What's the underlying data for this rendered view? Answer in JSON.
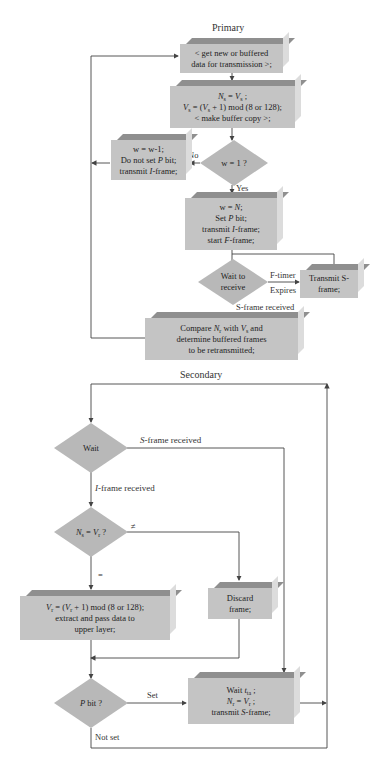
{
  "primary": {
    "title": "Primary",
    "get_data_box": {
      "line1": "< get new or buffered",
      "line2": "data for transmission >;"
    },
    "seq_box": {
      "line1_a": "N",
      "line1_sub": "s",
      "line1_b": " = ",
      "line1_c": "V",
      "line1_sub2": "s",
      "line1_d": " ;",
      "line2": "V_s = (V_s + 1) mod (8 or 128);",
      "line2_a": "V",
      "line2_sub": "s",
      "line2_b": " = (",
      "line2_c": "V",
      "line2_sub2": "s",
      "line2_d": " + 1) mod (8 or 128);",
      "line3": "< make buffer copy >;"
    },
    "window_decision": {
      "label": "w = 1 ?",
      "no_label": "No",
      "yes_label": "Yes"
    },
    "no_box": {
      "line1": "w = w-1;",
      "line2_a": "Do not set ",
      "line2_b": "P",
      "line2_c": " bit;",
      "line3_a": "transmit ",
      "line3_b": "I",
      "line3_c": "-frame;"
    },
    "yes_box": {
      "line1_a": "w = ",
      "line1_b": "N",
      "line1_c": ";",
      "line2_a": "Set ",
      "line2_b": "P",
      "line2_c": " bit;",
      "line3_a": "transmit ",
      "line3_b": "I",
      "line3_c": "-frame;",
      "line4_a": "start ",
      "line4_b": "F",
      "line4_c": "-frame;"
    },
    "wait_decision": {
      "line1": "Wait to",
      "line2": "receive",
      "timer_label1": "F-timer",
      "timer_label2": "Expires",
      "sframe_label": "S-frame received"
    },
    "transmit_s_box": {
      "line1": "Transmit S-",
      "line2": "frame;"
    },
    "compare_box": {
      "line1_a": "Compare ",
      "line1_b": "N",
      "line1_sub": "r",
      "line1_c": " with ",
      "line1_d": "V",
      "line1_sub2": "s",
      "line1_e": " and",
      "line2": "determine buffered frames",
      "line3": "to be retransmitted;"
    }
  },
  "secondary": {
    "title": "Secondary",
    "wait_decision": {
      "label": "Wait",
      "sframe_label_a": "S",
      "sframe_label_b": "-frame received",
      "iframe_label_a": "I",
      "iframe_label_b": "-frame received"
    },
    "seq_decision": {
      "a": "N",
      "sub1": "s",
      "b": " = ",
      "c": "V",
      "sub2": "r",
      "d": " ?",
      "neq_label": "≠",
      "eq_label": "="
    },
    "accept_box": {
      "line1_a": "V",
      "line1_sub": "r",
      "line1_b": " = (",
      "line1_c": "V",
      "line1_sub2": "r",
      "line1_d": " + 1) mod (8 or 128);",
      "line2": "extract and pass data to",
      "line3": "upper layer;"
    },
    "discard_box": {
      "line1": "Discard",
      "line2": "frame;"
    },
    "pbit_decision": {
      "a": "P",
      "b": " bit ?",
      "set_label": "Set",
      "not_set_label": "Not set"
    },
    "ack_box": {
      "line1_a": "Wait ",
      "line1_b": "t",
      "line1_sub": "ta",
      "line1_c": " ;",
      "line2_a": "N",
      "line2_sub": "r",
      "line2_b": " = ",
      "line2_c": "V",
      "line2_sub2": "r",
      "line2_d": " ;",
      "line3_a": "transmit ",
      "line3_b": "S",
      "line3_c": "-frame;"
    }
  },
  "colors": {
    "box_face": "#c4c4c4",
    "box_top": "#8f8f8f",
    "box_side": "#dcdcdc",
    "diamond": "#b8b8b8",
    "line": "#444444"
  }
}
